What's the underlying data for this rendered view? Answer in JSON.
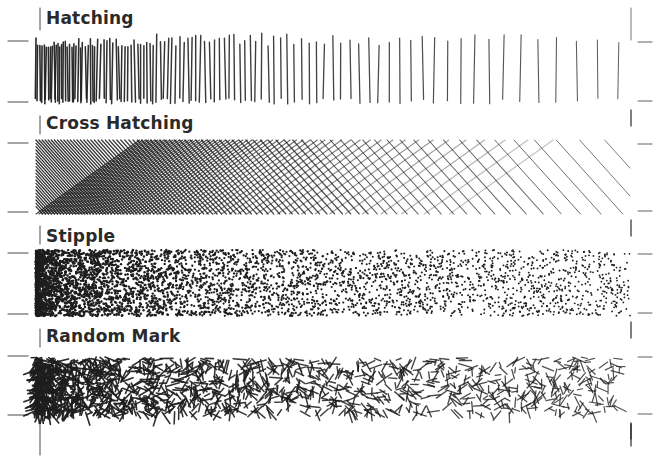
{
  "figure": {
    "panels": [
      {
        "id": "hatching",
        "label": "Hatching",
        "label_x": 46,
        "label_y": 8,
        "band_top": 38,
        "band_bottom": 104
      },
      {
        "id": "cross-hatching",
        "label": "Cross Hatching",
        "label_x": 46,
        "label_y": 113,
        "band_top": 140,
        "band_bottom": 214
      },
      {
        "id": "stipple",
        "label": "Stipple",
        "label_x": 46,
        "label_y": 226,
        "band_top": 250,
        "band_bottom": 316
      },
      {
        "id": "random-mark",
        "label": "Random Mark",
        "label_x": 46,
        "label_y": 326,
        "band_top": 353,
        "band_bottom": 417
      }
    ],
    "ink_color": "#1e1e1e",
    "paper_color": "#ffffff"
  }
}
